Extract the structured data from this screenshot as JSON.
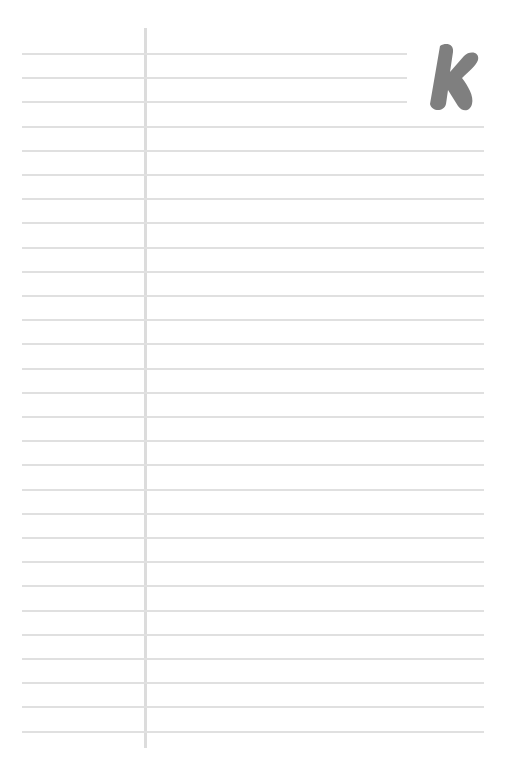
{
  "page": {
    "type": "lined-notepaper",
    "background_color": "#ffffff",
    "rule_color": "#e0e0e0",
    "margin_line_color": "#dcdcdc",
    "logo": {
      "letter": "K",
      "color": "#7f7f7f",
      "icon": "k-logo-icon"
    },
    "rules": {
      "first_y": 53,
      "spacing": 24.2,
      "count": 29,
      "short_rule_count": 3,
      "short_rule_end_x": 407,
      "full_rule_end_x": 484
    }
  }
}
